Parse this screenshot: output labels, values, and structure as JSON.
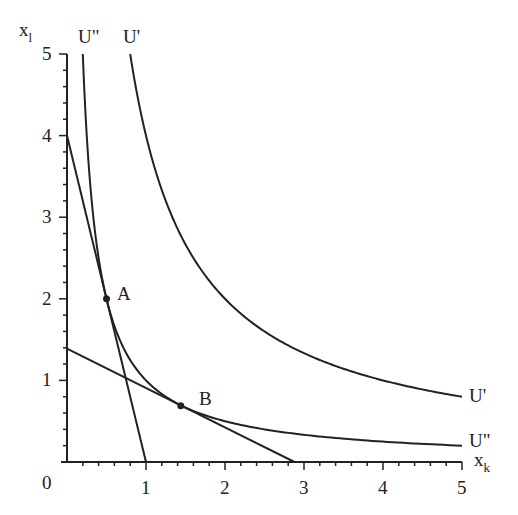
{
  "chart_data": {
    "type": "line",
    "title": "",
    "xlabel": "x_k",
    "ylabel": "x_l",
    "xlabel_main": "x",
    "xlabel_sub": "k",
    "ylabel_main": "x",
    "ylabel_sub": "l",
    "xlim": [
      0,
      5
    ],
    "ylim": [
      0,
      5
    ],
    "x_ticks": [
      "0",
      "1",
      "2",
      "3",
      "4",
      "5"
    ],
    "y_ticks": [
      "1",
      "2",
      "3",
      "4",
      "5"
    ],
    "origin_label": "0",
    "minor_tick_step": 0.2,
    "grid": false,
    "series": [
      {
        "name": "U'",
        "kind": "indifference_curve",
        "equation": "x_k * x_l = 4",
        "k": 4,
        "x_range": [
          0.8,
          5
        ],
        "label_top": "U'",
        "label_right": "U'"
      },
      {
        "name": "U''",
        "kind": "indifference_curve",
        "equation": "x_k * x_l = 1",
        "k": 1,
        "x_range": [
          0.2,
          5
        ],
        "label_top": "U\"",
        "label_right": "U\""
      },
      {
        "name": "budget line A",
        "kind": "line",
        "points": [
          [
            0,
            4
          ],
          [
            1,
            0
          ]
        ]
      },
      {
        "name": "budget line B",
        "kind": "line",
        "points": [
          [
            0,
            1.39
          ],
          [
            2.88,
            0
          ]
        ]
      }
    ],
    "annotations": [
      {
        "label": "A",
        "x": 0.5,
        "y": 2.0
      },
      {
        "label": "B",
        "x": 1.44,
        "y": 0.69
      }
    ]
  },
  "colors": {
    "line": "#222222",
    "background": "#ffffff"
  }
}
